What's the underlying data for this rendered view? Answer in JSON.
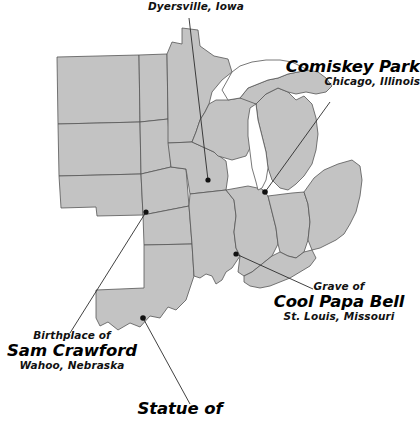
{
  "figure": {
    "kind": "annotated-map",
    "region": "United States Midwest",
    "background_color": "#ffffff",
    "state_fill_color": "#c3c3c3",
    "state_border_color": "#555555",
    "lake_fill_color": "#ffffff",
    "marker_color": "#111111",
    "leader_line_color": "#2b2b2b"
  },
  "labels": {
    "dyersville": {
      "line1": "Dyersville, Iowa"
    },
    "comiskey": {
      "title": "Comiskey Park",
      "subtitle": "Chicago, Illinois"
    },
    "coolpapa": {
      "prefix": "Grave of",
      "title": "Cool Papa Bell",
      "subtitle": "St. Louis, Missouri"
    },
    "crawford": {
      "prefix": "Birthplace of",
      "title": "Sam Crawford",
      "subtitle": "Wahoo, Nebraska"
    },
    "statue": {
      "title": "Statue of"
    }
  },
  "markers": [
    {
      "name": "dyersville-marker",
      "label": "Dyersville, Iowa",
      "x": 208,
      "y": 180
    },
    {
      "name": "comiskey-marker",
      "label": "Comiskey Park",
      "x": 265,
      "y": 192
    },
    {
      "name": "coolpapa-marker",
      "label": "Cool Papa Bell",
      "x": 236,
      "y": 254
    },
    {
      "name": "crawford-marker",
      "label": "Sam Crawford",
      "x": 146,
      "y": 212
    },
    {
      "name": "statue-marker",
      "label": "Statue of",
      "x": 143,
      "y": 318
    }
  ]
}
